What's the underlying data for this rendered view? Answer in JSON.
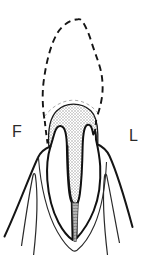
{
  "figure": {
    "labels": {
      "facial": "F",
      "lingual": "L"
    },
    "colors": {
      "ink": "#1a1a1a",
      "background": "#ffffff",
      "stipple_hatch": "#b5b5b5",
      "canal_filling": "#b8b8b8",
      "faint_dash": "#a0a0a0"
    }
  }
}
